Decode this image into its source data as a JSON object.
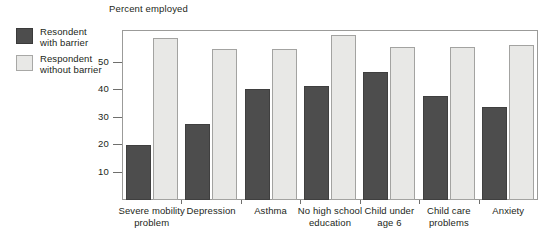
{
  "chart_data": {
    "type": "bar",
    "title": "Percent employed",
    "xlabel": "",
    "ylabel": "",
    "ylim": [
      0,
      62
    ],
    "yticks": [
      10,
      20,
      30,
      40,
      50
    ],
    "grid": false,
    "legend_position": "left",
    "categories": [
      "Severe mobility problem",
      "Depression",
      "Asthma",
      "No high school education",
      "Child under age 6",
      "Child care problems",
      "Anxiety"
    ],
    "category_lines": [
      [
        "Severe mobility",
        "problem"
      ],
      [
        "Depression"
      ],
      [
        "Asthma"
      ],
      [
        "No high school",
        "education"
      ],
      [
        "Child under",
        "age 6"
      ],
      [
        "Child care",
        "problems"
      ],
      [
        "Anxiety"
      ]
    ],
    "series": [
      {
        "name": "Resondent with barrier",
        "name_lines": [
          "Resondent",
          "with barrier"
        ],
        "color": "#4d4d4d",
        "values": [
          20,
          27.5,
          40.5,
          41.5,
          46.5,
          38,
          34
        ]
      },
      {
        "name": "Respondent without barrier",
        "name_lines": [
          "Respondent",
          "without barrier"
        ],
        "color": "#e8e8e6",
        "values": [
          59,
          55,
          55,
          60,
          55.5,
          55.5,
          56.5
        ]
      }
    ]
  },
  "colors": {
    "dark_bar": "#4d4d4d",
    "light_bar": "#e8e8e6",
    "axis": "#6f6f6d",
    "frame": "#9b9b99",
    "text": "#231f20",
    "background": "#ffffff"
  }
}
